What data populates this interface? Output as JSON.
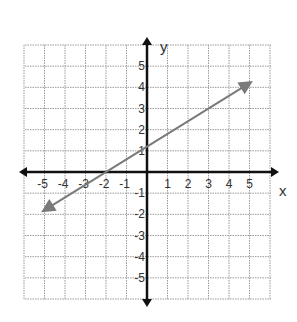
{
  "chart_data": {
    "type": "line",
    "title": "",
    "xlabel": "x",
    "ylabel": "y",
    "xlim": [
      -6,
      6
    ],
    "ylim": [
      -6,
      6
    ],
    "grid": true,
    "x_ticks": [
      "-5",
      "-4",
      "-3",
      "-2",
      "-1",
      "1",
      "2",
      "3",
      "4",
      "5"
    ],
    "y_ticks": [
      "5",
      "4",
      "3",
      "2",
      "1",
      "-1",
      "-2",
      "-3",
      "-4",
      "-5"
    ],
    "series": [
      {
        "name": "line",
        "equation": "y = 0.6x + 1.2",
        "slope": 0.6,
        "intercept": 1.2,
        "x": [
          -5,
          -2,
          0,
          3,
          5
        ],
        "y": [
          -1.8,
          0,
          1.2,
          3,
          4.2
        ],
        "arrows_both_ends": true,
        "color": "#7a7a7a"
      }
    ],
    "colors": {
      "axis": "#111111",
      "grid": "#9a9a9a",
      "line": "#7a7a7a"
    }
  }
}
